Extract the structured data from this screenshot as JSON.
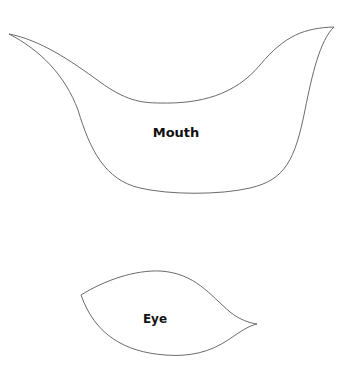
{
  "shapes": {
    "mouth": {
      "label": "Mouth"
    },
    "eye": {
      "label": "Eye"
    }
  },
  "colors": {
    "outline": "#6b6b6b",
    "text": "#111111",
    "background": "#ffffff"
  }
}
